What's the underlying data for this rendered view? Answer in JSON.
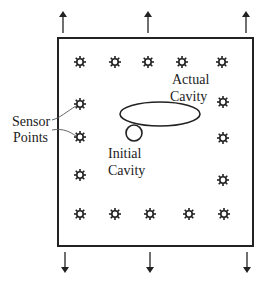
{
  "diagram": {
    "colors": {
      "stroke": "#222222",
      "background": "#ffffff"
    },
    "plate": {
      "x": 58,
      "y": 38,
      "width": 195,
      "height": 208
    },
    "load_arrows": {
      "top": [
        {
          "x": 63,
          "y1": 33,
          "y2": 14
        },
        {
          "x": 148,
          "y1": 33,
          "y2": 14
        },
        {
          "x": 246,
          "y1": 33,
          "y2": 14
        }
      ],
      "bottom": [
        {
          "x": 65,
          "y1": 252,
          "y2": 270
        },
        {
          "x": 150,
          "y1": 252,
          "y2": 270
        },
        {
          "x": 247,
          "y1": 252,
          "y2": 270
        }
      ]
    },
    "sensor_icon": "sun-star-icon",
    "sensors": [
      {
        "x": 80,
        "y": 62
      },
      {
        "x": 115,
        "y": 62
      },
      {
        "x": 148,
        "y": 62
      },
      {
        "x": 182,
        "y": 62
      },
      {
        "x": 222,
        "y": 62
      },
      {
        "x": 80,
        "y": 104
      },
      {
        "x": 80,
        "y": 137
      },
      {
        "x": 80,
        "y": 175
      },
      {
        "x": 223,
        "y": 102
      },
      {
        "x": 223,
        "y": 138
      },
      {
        "x": 223,
        "y": 180
      },
      {
        "x": 80,
        "y": 214
      },
      {
        "x": 115,
        "y": 214
      },
      {
        "x": 150,
        "y": 214
      },
      {
        "x": 189,
        "y": 214
      },
      {
        "x": 224,
        "y": 214
      }
    ],
    "actual_cavity": {
      "shape": "ellipse",
      "cx": 160,
      "cy": 114,
      "rx": 40,
      "ry": 12
    },
    "initial_cavity": {
      "shape": "circle",
      "cx": 134,
      "cy": 133,
      "r": 8
    },
    "labels": {
      "actual_cavity": [
        "Actual",
        "Cavity"
      ],
      "initial_cavity": [
        "Initial",
        "Cavity"
      ],
      "sensor_points": [
        "Sensor",
        "Points"
      ]
    }
  }
}
